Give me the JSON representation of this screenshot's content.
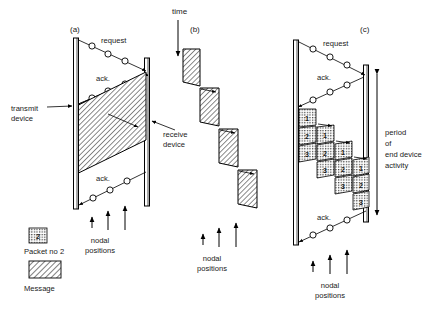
{
  "figure": {
    "title_axis": "time",
    "panels": [
      {
        "id": "a",
        "label": "(a)",
        "request_label": "request",
        "ack_label_upper": "ack.",
        "ack_label_lower": "ack.",
        "transmit_label_line1": "transmit",
        "transmit_label_line2": "device",
        "receive_label_line1": "receive",
        "receive_label_line2": "device",
        "nodal_label_line1": "nodal",
        "nodal_label_line2": "positions",
        "request_nodes": 3,
        "ack_upper_nodes": 3,
        "ack_lower_nodes": 3,
        "message_blocks": 1,
        "nodal_arrows": 3
      },
      {
        "id": "b",
        "label": "(b)",
        "nodal_label_line1": "nodal",
        "nodal_label_line2": "positions",
        "message_blocks": 4,
        "nodal_arrows": 3
      },
      {
        "id": "c",
        "label": "(c)",
        "request_label": "request",
        "ack_label_upper": "ack.",
        "ack_label_lower": "ack.",
        "nodal_label_line1": "nodal",
        "nodal_label_line2": "positions",
        "period_line1": "period",
        "period_line2": "of",
        "period_line3": "end device",
        "period_line4": "activity",
        "request_nodes": 3,
        "ack_upper_nodes": 3,
        "ack_lower_nodes": 3,
        "packet_columns": 4,
        "packet_numbers_per_column": [
          "1",
          "2",
          "3"
        ],
        "nodal_arrows": 3
      }
    ],
    "legend": {
      "packet_value": "2",
      "packet_caption": "Packet no 2",
      "message_caption": "Message"
    },
    "caption_cut": "",
    "colors": {
      "ink": "#1a1a1a",
      "stroke": "#000000",
      "background": "#ffffff",
      "hatch": "#000000"
    }
  }
}
